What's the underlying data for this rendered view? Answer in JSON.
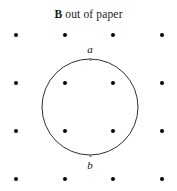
{
  "figure": {
    "width": 177,
    "height": 191,
    "background_color": "#ffffff"
  },
  "caption": {
    "field_symbol": "B",
    "text": " out of paper",
    "full_text": "B out of paper",
    "x": 90,
    "y": 16,
    "color": "#1a1a1a"
  },
  "field_dots": {
    "label": "magnetic-field-out-of-page-dots",
    "color": "#000000",
    "diameter": 4,
    "columns_x": [
      16,
      65,
      113,
      162
    ],
    "rows_y": [
      35,
      83,
      131,
      179
    ],
    "points": [
      {
        "x": 16,
        "y": 35
      },
      {
        "x": 65,
        "y": 35
      },
      {
        "x": 113,
        "y": 35
      },
      {
        "x": 162,
        "y": 35
      },
      {
        "x": 16,
        "y": 83
      },
      {
        "x": 65,
        "y": 83
      },
      {
        "x": 113,
        "y": 83
      },
      {
        "x": 162,
        "y": 83
      },
      {
        "x": 16,
        "y": 131
      },
      {
        "x": 65,
        "y": 131
      },
      {
        "x": 113,
        "y": 131
      },
      {
        "x": 162,
        "y": 131
      },
      {
        "x": 16,
        "y": 179
      },
      {
        "x": 65,
        "y": 179
      },
      {
        "x": 113,
        "y": 179
      },
      {
        "x": 162,
        "y": 179
      }
    ]
  },
  "loop": {
    "shape": "circle",
    "center_x": 90,
    "center_y": 107,
    "radius": 48,
    "stroke_color": "#1a1a1a",
    "stroke_width": 0.9,
    "fill": "none"
  },
  "points": [
    {
      "id": "point-a",
      "label": "a",
      "marker_x": 90,
      "marker_y": 59,
      "label_x": 90,
      "label_y": 44,
      "marker_color": "#8a8a8a"
    },
    {
      "id": "point-b",
      "label": "b",
      "marker_x": 90,
      "marker_y": 155,
      "label_x": 90,
      "label_y": 160,
      "marker_color": "#8a8a8a"
    }
  ],
  "chart_data": {
    "type": "diagram",
    "title": "B out of paper",
    "elements": [
      {
        "kind": "field-dot-array",
        "rows": 4,
        "cols": 4,
        "symbol": "dot",
        "meaning": "B out of paper"
      },
      {
        "kind": "circle",
        "cx": 90,
        "cy": 107,
        "r": 48
      },
      {
        "kind": "labeled-point",
        "name": "a",
        "x": 90,
        "y": 59
      },
      {
        "kind": "labeled-point",
        "name": "b",
        "x": 90,
        "y": 155
      }
    ]
  }
}
